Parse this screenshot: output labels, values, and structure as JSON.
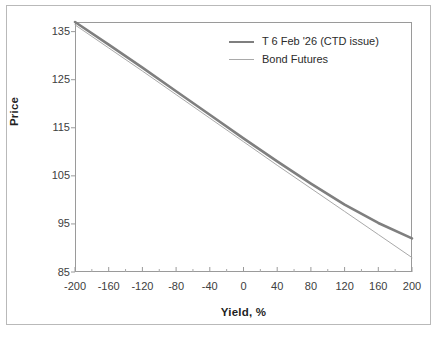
{
  "figure": {
    "background_color": "#ffffff",
    "outer_border_color": "#b9b9b9",
    "plot_border_color": "#9a9a9a"
  },
  "chart_data": {
    "type": "line",
    "title": "",
    "xlabel": "Yield, %",
    "ylabel": "Price",
    "xlim": [
      -200,
      200
    ],
    "ylim": [
      85,
      137
    ],
    "xticks": [
      -200,
      -160,
      -120,
      -80,
      -40,
      0,
      40,
      80,
      120,
      160,
      200
    ],
    "xtick_labels": [
      "-200",
      "-160",
      "-120",
      "-80",
      "-40",
      "0",
      "40",
      "80",
      "120",
      "160",
      "200"
    ],
    "x_minor_tick_step": 20,
    "yticks": [
      85,
      95,
      105,
      115,
      125,
      135
    ],
    "ytick_labels": [
      "85",
      "95",
      "105",
      "115",
      "125",
      "135"
    ],
    "grid": false,
    "legend_position": "top-right-inside",
    "x": [
      -200,
      -160,
      -120,
      -80,
      -40,
      0,
      40,
      80,
      120,
      160,
      200
    ],
    "series": [
      {
        "name": "T 6 Feb '26 (CTD issue)",
        "color": "#7f7f7f",
        "width": 2.6,
        "values": [
          137.0,
          132.3,
          127.5,
          122.6,
          117.7,
          112.8,
          108.0,
          103.4,
          99.0,
          95.2,
          92.0
        ]
      },
      {
        "name": "Bond Futures",
        "color": "#a9a9a9",
        "width": 1.0,
        "values": [
          136.4,
          131.6,
          126.8,
          121.9,
          117.0,
          112.1,
          107.2,
          102.4,
          97.6,
          92.8,
          88.0
        ]
      }
    ]
  },
  "legend": {
    "items": [
      {
        "label": "T 6 Feb '26 (CTD issue)",
        "color": "#7f7f7f",
        "width": 2.6
      },
      {
        "label": "Bond Futures",
        "color": "#a9a9a9",
        "width": 1.0
      }
    ]
  }
}
